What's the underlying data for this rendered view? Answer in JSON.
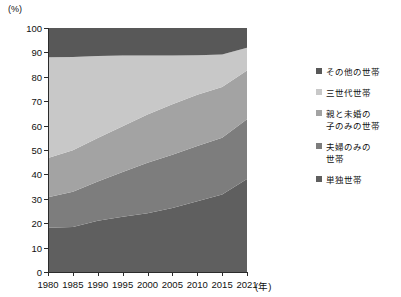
{
  "axes": {
    "y_unit": "(%)",
    "y_ticks": [
      0,
      10,
      20,
      30,
      40,
      50,
      60,
      70,
      80,
      90,
      100
    ],
    "x_unit": "(年)",
    "x_ticks": [
      "1980",
      "1985",
      "1990",
      "1995",
      "2000",
      "2005",
      "2010",
      "2015",
      "2021"
    ]
  },
  "legend": {
    "items": [
      {
        "label": "その他の世帯",
        "color": "#585858"
      },
      {
        "label": "三世代世帯",
        "color": "#c8c8c8"
      },
      {
        "label": "親と未婚の\n子のみの世帯",
        "color": "#a3a3a3"
      },
      {
        "label": "夫婦のみの\n世帯",
        "color": "#7d7d7d"
      },
      {
        "label": "単独世帯",
        "color": "#5f5f5f"
      }
    ]
  },
  "chart_data": {
    "type": "area",
    "title": "",
    "xlabel": "(年)",
    "ylabel": "(%)",
    "ylim": [
      0,
      100
    ],
    "xlim": [
      1980,
      2021
    ],
    "grid": false,
    "legend_position": "right",
    "stacked": true,
    "x": [
      1980,
      1985,
      1990,
      1995,
      2000,
      2005,
      2010,
      2015,
      2021
    ],
    "series": [
      {
        "name": "単独世帯",
        "color": "#5f5f5f",
        "values": [
          18.1,
          18.4,
          21.0,
          22.6,
          24.1,
          26.2,
          29.0,
          31.8,
          38.1
        ]
      },
      {
        "name": "夫婦のみの世帯",
        "color": "#7d7d7d",
        "values": [
          12.5,
          14.5,
          16.1,
          18.4,
          20.7,
          21.9,
          22.6,
          23.2,
          24.5
        ]
      },
      {
        "name": "親と未婚の子のみの世帯",
        "color": "#a3a3a3",
        "values": [
          16.1,
          17.0,
          17.8,
          18.7,
          19.8,
          20.6,
          21.0,
          20.8,
          20.0
        ]
      },
      {
        "name": "三世代世帯",
        "color": "#c8c8c8",
        "values": [
          41.3,
          38.2,
          33.6,
          29.0,
          24.1,
          20.0,
          16.2,
          13.3,
          9.3
        ]
      },
      {
        "name": "その他の世帯",
        "color": "#585858",
        "values": [
          12.0,
          11.9,
          11.5,
          11.3,
          11.3,
          11.3,
          11.2,
          10.9,
          8.1
        ]
      }
    ]
  }
}
